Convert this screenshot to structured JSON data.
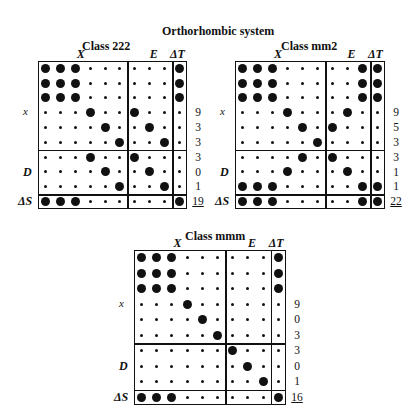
{
  "figure": {
    "title": "Orthorhombic system"
  },
  "labels": {
    "col_X": "X",
    "col_E": "E",
    "col_dT": "ΔT",
    "row_x": "x",
    "row_D": "D",
    "row_dS": "ΔS"
  },
  "matrices": [
    {
      "name": "Class 222",
      "rows": [
        "LLLsss|sss|L",
        "LLLsss|sss|L",
        "LLLsss|sss|L",
        "sssLss|Lss|s",
        "ssssLs|sLs|s",
        "sssssL|ssL|s",
        "sssLss|Lss|s",
        "ssssLs|sLs|s",
        "sssssL|ssL|s",
        "LLLsss|sss|L"
      ],
      "counts": [
        "",
        "",
        "",
        "9",
        "3",
        "3",
        "3",
        "0",
        "1"
      ],
      "total": "19"
    },
    {
      "name": "Class mm2",
      "rows": [
        "LLLsss|ssL|L",
        "LLLsss|ssL|L",
        "LLLsss|ssL|L",
        "sssLss|sLs|s",
        "ssssLs|Lss|s",
        "sssssL|sss|s",
        "ssssLs|Lss|s",
        "sssLss|sLs|s",
        "LLLsss|ssL|L",
        "LLLsss|ssL|L"
      ],
      "counts": [
        "",
        "",
        "",
        "9",
        "5",
        "3",
        "3",
        "1",
        "1"
      ],
      "total": "22"
    },
    {
      "name": "Class mmm",
      "rows": [
        "LLLsss|sss|L",
        "LLLsss|sss|L",
        "LLLsss|sss|L",
        "sssLss|sss|s",
        "ssssLs|sss|s",
        "sssssL|sss|s",
        "ssssss|Lss|s",
        "ssssss|sLs|s",
        "ssssss|ssL|s",
        "LLLsss|sss|L"
      ],
      "counts": [
        "",
        "",
        "",
        "9",
        "0",
        "3",
        "3",
        "0",
        "1"
      ],
      "total": "16"
    }
  ]
}
